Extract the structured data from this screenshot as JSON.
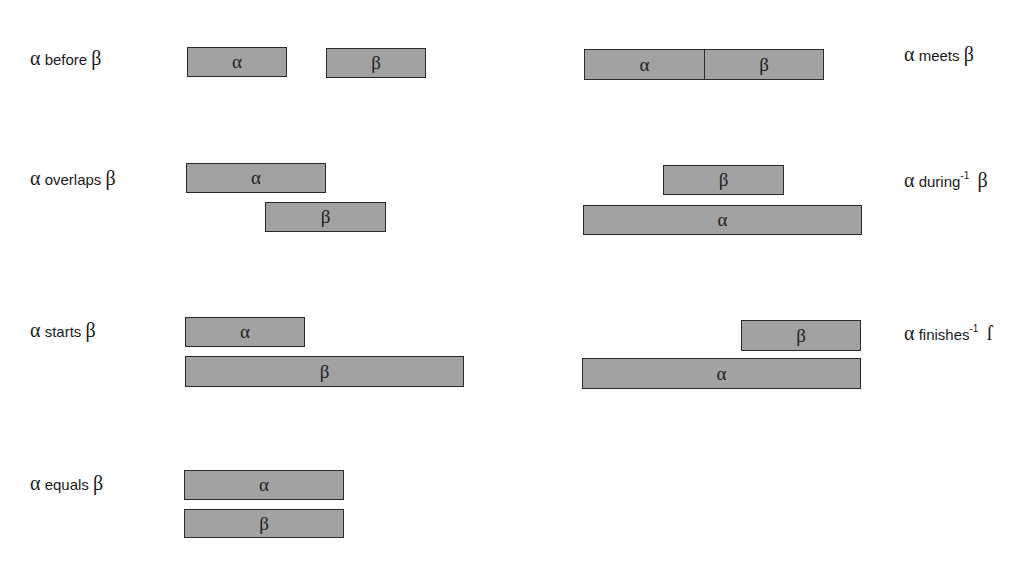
{
  "alpha": "α",
  "beta": "β",
  "relations": [
    {
      "id": "before",
      "pre": "α",
      "text": " before ",
      "sup": "",
      "post": "β",
      "label_pos": [
        30,
        48
      ],
      "bars": [
        {
          "sym": "α",
          "x": 187,
          "y": 47,
          "w": 100,
          "h": 30
        },
        {
          "sym": "β",
          "x": 326,
          "y": 48,
          "w": 100,
          "h": 30
        }
      ]
    },
    {
      "id": "meets",
      "pre": "α",
      "text": " meets ",
      "sup": "",
      "post": "β",
      "label_pos": [
        904,
        44
      ],
      "bars": [
        {
          "sym": "α",
          "x": 584,
          "y": 49,
          "w": 121,
          "h": 31
        },
        {
          "sym": "β",
          "x": 704,
          "y": 49,
          "w": 120,
          "h": 31
        }
      ]
    },
    {
      "id": "overlaps",
      "pre": "α",
      "text": " overlaps ",
      "sup": "",
      "post": "β",
      "label_pos": [
        30,
        168
      ],
      "bars": [
        {
          "sym": "α",
          "x": 186,
          "y": 163,
          "w": 140,
          "h": 30
        },
        {
          "sym": "β",
          "x": 265,
          "y": 202,
          "w": 121,
          "h": 30
        }
      ]
    },
    {
      "id": "during-inverse",
      "pre": "α",
      "text": " during",
      "sup": "-1",
      "post": "β",
      "label_pos": [
        904,
        168
      ],
      "bars": [
        {
          "sym": "β",
          "x": 663,
          "y": 165,
          "w": 121,
          "h": 30
        },
        {
          "sym": "α",
          "x": 583,
          "y": 205,
          "w": 279,
          "h": 30
        }
      ]
    },
    {
      "id": "starts",
      "pre": "α",
      "text": " starts ",
      "sup": "",
      "post": "β",
      "label_pos": [
        30,
        320
      ],
      "bars": [
        {
          "sym": "α",
          "x": 185,
          "y": 317,
          "w": 120,
          "h": 30
        },
        {
          "sym": "β",
          "x": 185,
          "y": 356,
          "w": 279,
          "h": 31
        }
      ]
    },
    {
      "id": "finishes-inverse",
      "pre": "α",
      "text": " finishes",
      "sup": "-1",
      "post": "ſ",
      "label_pos": [
        904,
        321
      ],
      "bars": [
        {
          "sym": "β",
          "x": 741,
          "y": 320,
          "w": 120,
          "h": 31
        },
        {
          "sym": "α",
          "x": 582,
          "y": 358,
          "w": 279,
          "h": 31
        }
      ]
    },
    {
      "id": "equals",
      "pre": "α",
      "text": " equals ",
      "sup": "",
      "post": "β",
      "label_pos": [
        30,
        473
      ],
      "bars": [
        {
          "sym": "α",
          "x": 184,
          "y": 470,
          "w": 160,
          "h": 30
        },
        {
          "sym": "β",
          "x": 184,
          "y": 509,
          "w": 160,
          "h": 29
        }
      ]
    }
  ],
  "colors": {
    "bar_fill": "#c9c9c9",
    "bar_border": "#2a2a2a",
    "text": "#1a1a1a"
  }
}
